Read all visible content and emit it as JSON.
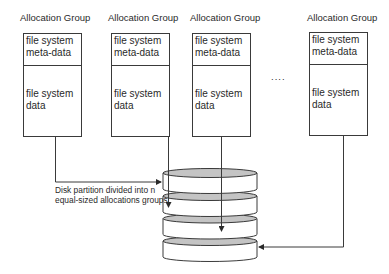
{
  "diagram": {
    "groups": [
      {
        "title": "Allocation Group",
        "meta_line1": "file system",
        "meta_line2": "meta-data",
        "data_line1": "file system",
        "data_line2": "data"
      },
      {
        "title": "Allocation Group",
        "meta_line1": "file system",
        "meta_line2": "meta-data",
        "data_line1": "file system",
        "data_line2": "data"
      },
      {
        "title": "Allocation Group",
        "meta_line1": "file system",
        "meta_line2": "meta-data",
        "data_line1": "file system",
        "data_line2": "data"
      },
      {
        "title": "Allocation Group",
        "meta_line1": "file system",
        "meta_line2": "meta-data",
        "data_line1": "file system",
        "data_line2": "data"
      }
    ],
    "ellipsis": "....",
    "caption_line1": "Disk partition divided into n",
    "caption_line2": "equal-sized allocations groups",
    "disk_count": 4,
    "colors": {
      "stroke": "#3a3a3a",
      "disk_top": "#c4c4c4",
      "box_fill": "#ffffff"
    }
  }
}
